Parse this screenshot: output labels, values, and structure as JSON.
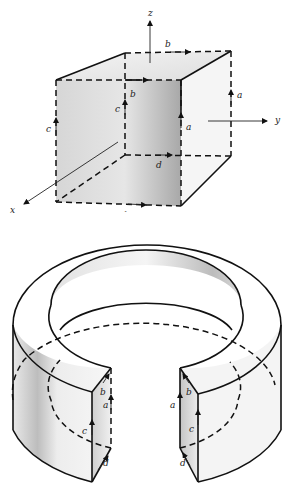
{
  "figure": {
    "type": "two-panel line drawing",
    "top_panel": {
      "subject": "cube with coordinate axes",
      "axes": [
        {
          "name": "z",
          "label": "z"
        },
        {
          "name": "y",
          "label": "y"
        },
        {
          "name": "x",
          "label": "x"
        }
      ],
      "edge_labels": {
        "top_back": "b",
        "top_front": "b",
        "left_front": "c",
        "left_back": "c",
        "right_front": "a",
        "right_back": "a",
        "bottom_back": "d",
        "bottom_front": "d"
      }
    },
    "bottom_panel": {
      "subject": "split ring (bent cube into annulus with gap)",
      "left_face_labels": {
        "b": "b",
        "a": "a",
        "c": "c",
        "d": "d"
      },
      "right_face_labels": {
        "b": "b",
        "a": "a",
        "c": "c",
        "d": "d"
      }
    },
    "colors": {
      "ink": "#111111",
      "shade_dark": "#9a9a9a",
      "shade_light": "#f2f2f2",
      "background": "#ffffff"
    }
  }
}
